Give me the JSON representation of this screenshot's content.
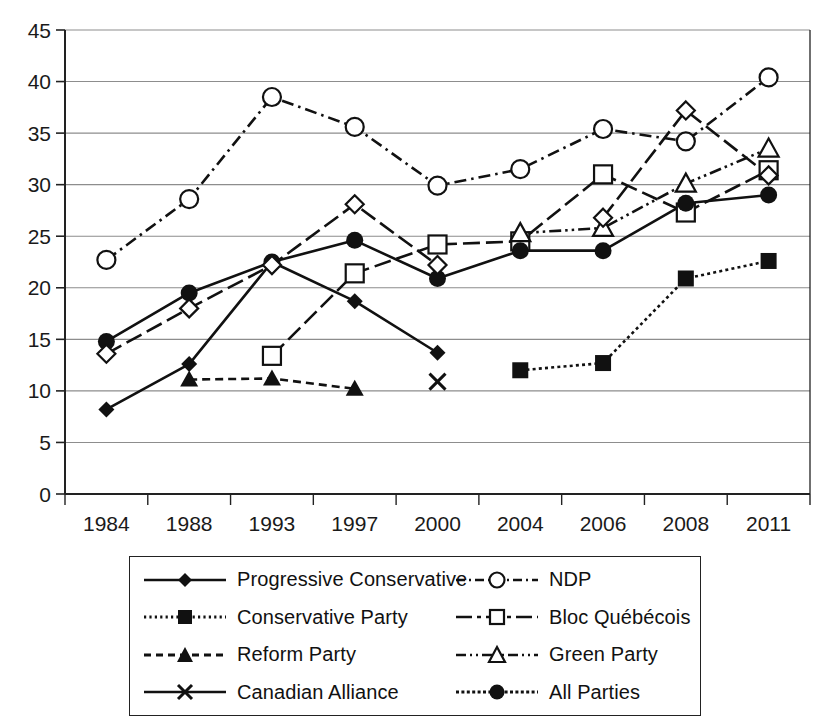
{
  "chart_data": {
    "type": "line",
    "title": "",
    "xlabel": "",
    "ylabel": "",
    "categories": [
      "1984",
      "1988",
      "1993",
      "1997",
      "2000",
      "2004",
      "2006",
      "2008",
      "2011"
    ],
    "ylim": [
      0,
      45
    ],
    "ytick_step": 5,
    "yticks": [
      "0",
      "5",
      "10",
      "15",
      "20",
      "25",
      "30",
      "35",
      "40",
      "45"
    ],
    "grid": "horizontal",
    "legend_position": "bottom",
    "series": [
      {
        "name": "Progressive Conservative",
        "marker": "filled-diamond",
        "line": "solid",
        "values": [
          8.2,
          12.6,
          22.5,
          18.7,
          13.7,
          null,
          null,
          null,
          30.9
        ]
      },
      {
        "name": "Conservative Party",
        "marker": "filled-square",
        "line": "dotted",
        "values": [
          null,
          null,
          null,
          null,
          null,
          12.0,
          12.7,
          20.9,
          22.6
        ]
      },
      {
        "name": "Reform Party",
        "marker": "filled-triangle",
        "line": "dashed",
        "values": [
          null,
          11.1,
          11.2,
          10.2,
          null,
          null,
          null,
          null,
          null
        ]
      },
      {
        "name": "Canadian Alliance",
        "marker": "cross",
        "line": "solid",
        "values": [
          null,
          null,
          null,
          null,
          10.9,
          null,
          null,
          null,
          null
        ]
      },
      {
        "name": "NDP",
        "marker": "open-circle",
        "line": "dash-dot",
        "values": [
          22.7,
          28.6,
          38.5,
          35.6,
          29.9,
          31.5,
          35.4,
          34.2,
          40.4
        ]
      },
      {
        "name": "Bloc Québécois",
        "marker": "open-square",
        "line": "long-dash",
        "values": [
          null,
          null,
          13.4,
          21.4,
          24.2,
          24.5,
          31.0,
          27.3,
          31.4
        ]
      },
      {
        "name": "Green Party",
        "marker": "open-triangle",
        "line": "dash-dot-dot",
        "values": [
          null,
          null,
          null,
          null,
          null,
          25.3,
          25.8,
          30.1,
          33.5
        ]
      },
      {
        "name": "All Parties",
        "marker": "filled-circle",
        "line": "solid",
        "values": [
          14.8,
          19.5,
          22.5,
          24.6,
          20.9,
          23.6,
          23.6,
          28.2,
          29.0
        ]
      },
      {
        "name": "Green Party (diamond)",
        "marker": "open-diamond",
        "line": "long-dash",
        "values": [
          13.6,
          18.0,
          22.2,
          28.1,
          22.2,
          null,
          26.8,
          37.2,
          30.9
        ]
      }
    ]
  },
  "legend": {
    "entries": [
      {
        "label": "Progressive Conservative"
      },
      {
        "label": "NDP"
      },
      {
        "label": "Conservative Party"
      },
      {
        "label": "Bloc Québécois"
      },
      {
        "label": "Reform Party"
      },
      {
        "label": "Green Party"
      },
      {
        "label": "Canadian Alliance"
      },
      {
        "label": "All Parties"
      }
    ]
  },
  "colors": {
    "ink": "#111111",
    "grid": "#8d8d8d",
    "axis": "#222222"
  }
}
